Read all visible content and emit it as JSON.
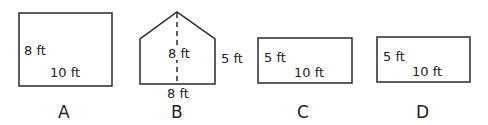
{
  "figures": [
    {
      "id": "A",
      "caption": "A",
      "shape": "rectangle",
      "labels": {
        "height": "8 ft",
        "width": "10 ft"
      }
    },
    {
      "id": "B",
      "caption": "B",
      "shape": "pentagon",
      "labels": {
        "center_height": "8 ft",
        "side_height": "5 ft",
        "base": "8 ft"
      }
    },
    {
      "id": "C",
      "caption": "C",
      "shape": "rectangle",
      "labels": {
        "height": "5 ft",
        "width": "10 ft"
      }
    },
    {
      "id": "D",
      "caption": "D",
      "shape": "rectangle",
      "labels": {
        "height": "5 ft",
        "width": "10 ft"
      }
    }
  ],
  "colors": {
    "stroke": "#2a2a2a",
    "text": "#222222"
  }
}
